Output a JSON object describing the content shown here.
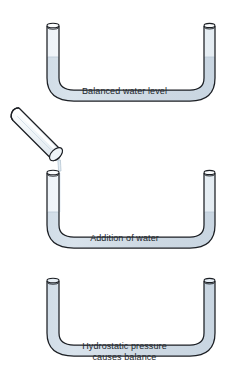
{
  "diagram": {
    "background_color": "#ffffff",
    "outline_color": "#1c1f24",
    "water_color": "#ccd9e4",
    "water_color_light": "#dde7ef",
    "glass_highlight_color": "#f4f8fb",
    "panels": [
      {
        "id": "panel-balanced",
        "caption": "Balanced water level",
        "water_level_label": "balanced",
        "has_pouring_tube": false
      },
      {
        "id": "panel-addition",
        "caption": "Addition of water",
        "water_level_label": "low",
        "has_pouring_tube": true,
        "pouring_tube_name": "tilted test tube pouring water"
      },
      {
        "id": "panel-hydrostatic",
        "caption": "Hydrostatic pressure\ncauses balance",
        "water_level_label": "full",
        "has_pouring_tube": false
      }
    ]
  }
}
